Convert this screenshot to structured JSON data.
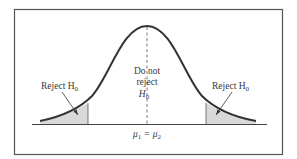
{
  "diagram": {
    "type": "hypothesis-test-rejection-regions",
    "curve": "normal distribution (two-tailed)",
    "labels": {
      "left_region": "Reject H",
      "left_region_sub": "0",
      "right_region": "Reject H",
      "right_region_sub": "0",
      "center_line1": "Do not",
      "center_line2": "reject",
      "center_line3": "H",
      "center_line3_sub": "0",
      "axis_mu1": "μ",
      "axis_mu1_sub": "1",
      "axis_equals": "=",
      "axis_mu2": "μ",
      "axis_mu2_sub": "2"
    },
    "colors": {
      "curve": "#333333",
      "shade": "#d9d9d9",
      "frame": "#555555",
      "text": "#3a3a3a"
    }
  }
}
